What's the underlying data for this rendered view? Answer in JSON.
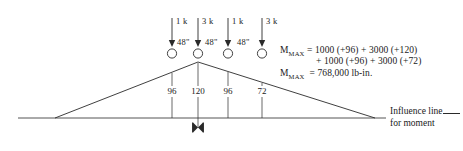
{
  "figure": {
    "type": "influence-line-diagram",
    "background_color": "#ffffff",
    "ink_color": "#2a2a2a"
  },
  "loads": [
    {
      "magnitude": "1 k",
      "x": 172
    },
    {
      "magnitude": "3 k",
      "x": 198
    },
    {
      "magnitude": "1 k",
      "x": 228
    },
    {
      "magnitude": "3 k",
      "x": 262
    }
  ],
  "spacings": [
    {
      "label": "48\"",
      "between": [
        172,
        198
      ]
    },
    {
      "label": "48\"",
      "between": [
        198,
        228
      ]
    },
    {
      "label": "48\"",
      "between": [
        228,
        262
      ]
    }
  ],
  "ordinates": [
    {
      "value": "96",
      "x": 172
    },
    {
      "value": "120",
      "x": 198
    },
    {
      "value": "96",
      "x": 228
    },
    {
      "value": "72",
      "x": 262
    }
  ],
  "equation": {
    "line1": "= 1000 (+96) + 3000 (+120)",
    "line2": "+ 1000 (+96) + 3000 (+72)",
    "line3": "= 768,000 lb-in.",
    "symbol_main": "M",
    "symbol_sub": "MAX"
  },
  "influence_line_caption": {
    "line1": "Influence line",
    "line2": "for moment"
  },
  "geometry": {
    "baseline_y": 118,
    "apex_x": 198,
    "apex_y": 62,
    "left_vertex_x": 55,
    "right_vertex_x": 375,
    "baseline_left_x": 18,
    "baseline_right_x": 386,
    "section_marker_x": 198
  }
}
